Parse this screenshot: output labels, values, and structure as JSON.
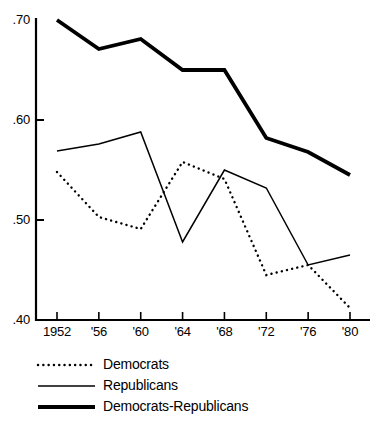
{
  "chart_data": {
    "type": "line",
    "title": "",
    "subtitle": "",
    "xlabel": "",
    "ylabel": "",
    "x": [
      1952,
      1956,
      1960,
      1964,
      1968,
      1972,
      1976,
      1980
    ],
    "xtick_labels": [
      "1952",
      "'56",
      "'60",
      "'64",
      "'68",
      "'72",
      "'76",
      "'80"
    ],
    "ytick_labels": [
      ".70",
      ".60",
      ".50",
      ".40"
    ],
    "ytick_values": [
      0.7,
      0.6,
      0.5,
      0.4
    ],
    "ylim": [
      0.4,
      0.7
    ],
    "xlim": [
      1950.6,
      1981.4
    ],
    "grid": false,
    "legend_position": "bottom-left",
    "series": [
      {
        "name": "Democrats",
        "style": "dotted",
        "color": "#000000",
        "linewidth": 2.2,
        "values": [
          0.548,
          0.503,
          0.491,
          0.558,
          0.541,
          0.445,
          0.455,
          0.412
        ]
      },
      {
        "name": "Republicans",
        "style": "solid-thin",
        "color": "#000000",
        "linewidth": 1.4,
        "values": [
          0.569,
          0.576,
          0.588,
          0.478,
          0.55,
          0.532,
          0.455,
          0.465
        ]
      },
      {
        "name": "Democrats-Republicans",
        "style": "solid-thick",
        "color": "#000000",
        "linewidth": 3.6,
        "values": [
          0.7,
          0.671,
          0.681,
          0.65,
          0.65,
          0.582,
          0.568,
          0.545
        ]
      }
    ]
  },
  "axes": {
    "left_color": "#000000",
    "bottom_color": "#000000"
  },
  "legend": {
    "items": [
      {
        "label": "Democrats",
        "style": "dotted"
      },
      {
        "label": "Republicans",
        "style": "solid-thin"
      },
      {
        "label": "Democrats-Republicans",
        "style": "solid-thick"
      }
    ]
  }
}
